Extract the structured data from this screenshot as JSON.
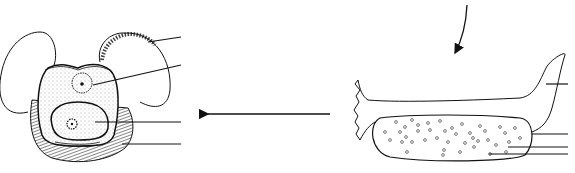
{
  "diagram": {
    "type": "biological-line-drawing",
    "colors": {
      "line": "#111111",
      "background": "#ffffff"
    },
    "left_figure": {
      "name": "cell-with-air-sacs",
      "label_lines": 4
    },
    "right_figure": {
      "name": "elongated-structure-with-granular-body",
      "label_lines": 4
    },
    "arrows": [
      {
        "name": "curved-down-arrow",
        "direction": "down-left"
      },
      {
        "name": "left-arrow",
        "direction": "left"
      }
    ]
  }
}
